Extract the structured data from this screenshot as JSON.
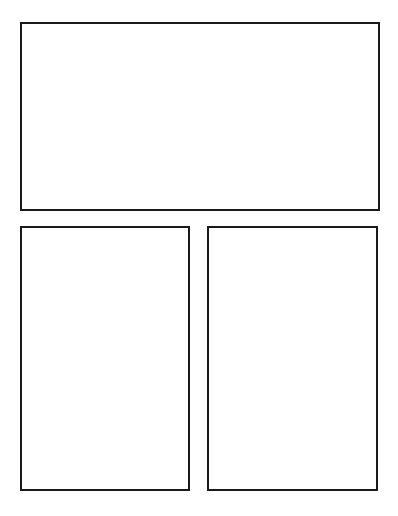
{
  "page": {
    "type": "comic-panel-template",
    "background": "#ffffff",
    "border_color": "#1a1a1a",
    "panels": [
      {
        "name": "top-panel",
        "content": ""
      },
      {
        "name": "bottom-left-panel",
        "content": ""
      },
      {
        "name": "bottom-right-panel",
        "content": ""
      }
    ]
  }
}
